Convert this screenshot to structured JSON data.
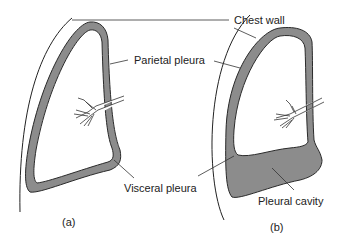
{
  "labels": {
    "chest_wall": "Chest wall",
    "parietal_pleura": "Parietal pleura",
    "visceral_pleura": "Visceral pleura",
    "pleural_cavity": "Pleural cavity",
    "panel_a": "(a)",
    "panel_b": "(b)"
  },
  "colors": {
    "pleura_gray": "#8c8c8c",
    "outline": "#2a2a2a",
    "background": "#ffffff"
  }
}
